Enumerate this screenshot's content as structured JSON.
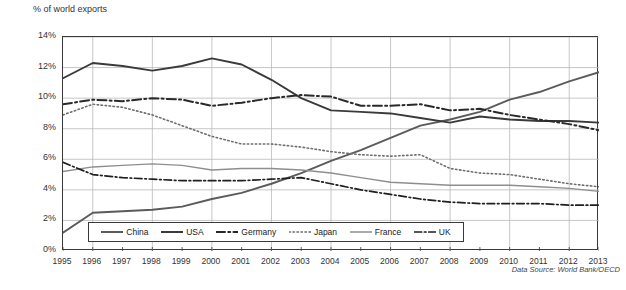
{
  "axis_title": "% of world exports",
  "source_note": "Data Source: World Bank/OECD",
  "legend": {
    "items": [
      {
        "label": "China",
        "key": "china"
      },
      {
        "label": "USA",
        "key": "usa"
      },
      {
        "label": "Germany",
        "key": "germany"
      },
      {
        "label": "Japan",
        "key": "japan"
      },
      {
        "label": "France",
        "key": "france"
      },
      {
        "label": "UK",
        "key": "uk"
      }
    ]
  },
  "chart_data": {
    "type": "line",
    "title": "",
    "xlabel": "",
    "ylabel": "% of world exports",
    "ylim": [
      0,
      14
    ],
    "yticks": [
      "0%",
      "2%",
      "4%",
      "6%",
      "8%",
      "10%",
      "12%",
      "14%"
    ],
    "ytick_values": [
      0,
      2,
      4,
      6,
      8,
      10,
      12,
      14
    ],
    "grid": true,
    "legend_position": "bottom",
    "x": [
      1995,
      1996,
      1997,
      1998,
      1999,
      2000,
      2001,
      2002,
      2003,
      2004,
      2005,
      2006,
      2007,
      2008,
      2009,
      2010,
      2011,
      2012,
      2013
    ],
    "xticks": [
      "1995",
      "1996",
      "1997",
      "1998",
      "1999",
      "2000",
      "2001",
      "2002",
      "2003",
      "2004",
      "2005",
      "2006",
      "2007",
      "2008",
      "2009",
      "2010",
      "2011",
      "2012",
      "2013"
    ],
    "series": [
      {
        "name": "China",
        "style": "solid",
        "color": "#5b5b5b",
        "width": 1.9,
        "values": [
          1.2,
          2.5,
          2.6,
          2.7,
          2.9,
          3.4,
          3.8,
          4.4,
          5.1,
          5.9,
          6.6,
          7.4,
          8.2,
          8.6,
          9.1,
          9.9,
          10.4,
          11.1,
          11.7
        ]
      },
      {
        "name": "USA",
        "style": "solid",
        "color": "#3a3a3a",
        "width": 1.9,
        "values": [
          11.3,
          12.3,
          12.1,
          11.8,
          12.1,
          12.6,
          12.2,
          11.2,
          10.0,
          9.2,
          9.1,
          9.0,
          8.7,
          8.4,
          8.8,
          8.6,
          8.5,
          8.5,
          8.4
        ]
      },
      {
        "name": "Germany",
        "style": "dashdot",
        "color": "#2a2a2a",
        "width": 2.0,
        "values": [
          9.6,
          9.9,
          9.8,
          10.0,
          9.9,
          9.5,
          9.7,
          10.0,
          10.2,
          10.1,
          9.5,
          9.5,
          9.6,
          9.2,
          9.3,
          8.9,
          8.6,
          8.3,
          7.9
        ]
      },
      {
        "name": "Japan",
        "style": "dotted",
        "color": "#6e6e6e",
        "width": 1.6,
        "values": [
          8.9,
          9.6,
          9.4,
          8.9,
          8.2,
          7.5,
          7.0,
          7.0,
          6.8,
          6.5,
          6.3,
          6.2,
          6.3,
          5.4,
          5.1,
          5.0,
          4.7,
          4.4,
          4.2
        ]
      },
      {
        "name": "France",
        "style": "solid",
        "color": "#8e8e8e",
        "width": 1.4,
        "values": [
          5.2,
          5.5,
          5.6,
          5.7,
          5.6,
          5.3,
          5.4,
          5.4,
          5.3,
          5.1,
          4.8,
          4.5,
          4.4,
          4.3,
          4.3,
          4.3,
          4.2,
          4.1,
          3.9
        ]
      },
      {
        "name": "UK",
        "style": "dashdot",
        "color": "#1f1f1f",
        "width": 1.7,
        "values": [
          5.8,
          5.0,
          4.8,
          4.7,
          4.6,
          4.6,
          4.6,
          4.7,
          4.8,
          4.4,
          4.0,
          3.7,
          3.4,
          3.2,
          3.1,
          3.1,
          3.1,
          3.0,
          3.0
        ]
      }
    ]
  }
}
